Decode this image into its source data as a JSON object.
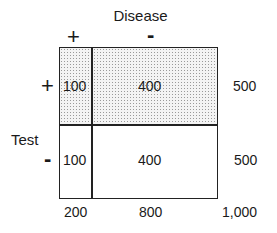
{
  "diagram": {
    "title": "Disease",
    "row_label": "Test",
    "column_headers": [
      "+",
      "-"
    ],
    "row_headers": [
      "+",
      "-"
    ],
    "cells": [
      [
        "100",
        "400"
      ],
      [
        "100",
        "400"
      ]
    ],
    "row_totals": [
      "500",
      "500"
    ],
    "column_totals": [
      "200",
      "800"
    ],
    "grand_total": "1,000",
    "shading": {
      "row": 0,
      "pattern": "stippled",
      "color": "#9a9a9a"
    }
  }
}
